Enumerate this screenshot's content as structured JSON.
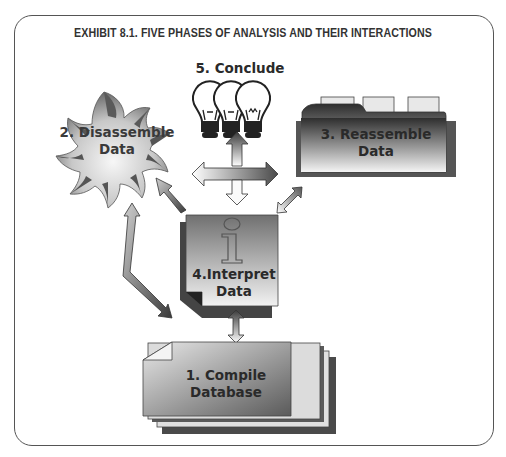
{
  "exhibit": {
    "title": "EXHIBIT 8.1.  FIVE PHASES OF ANALYSIS AND THEIR INTERACTIONS"
  },
  "phases": [
    {
      "number": "1.",
      "line1": "1. Compile",
      "line2": "Database",
      "icon": "stacked-documents-icon"
    },
    {
      "number": "2.",
      "line1": "2. Disassemble",
      "line2": "Data",
      "icon": "burst-flower-icon"
    },
    {
      "number": "3.",
      "line1": "3. Reassemble",
      "line2": "Data",
      "icon": "folder-tabs-icon"
    },
    {
      "number": "4.",
      "line1": "4.Interpret",
      "line2": "Data",
      "icon": "info-document-icon"
    },
    {
      "number": "5.",
      "line1": "5. Conclude",
      "line2": "",
      "icon": "light-bulbs-icon"
    }
  ],
  "connections": [
    {
      "from": "1. Compile Database",
      "to": "4. Interpret Data",
      "type": "bidirectional"
    },
    {
      "from": "1. Compile Database",
      "to": "2. Disassemble Data",
      "type": "bidirectional"
    },
    {
      "from": "4. Interpret Data",
      "to": "2. Disassemble Data",
      "type": "directional"
    },
    {
      "from": "4. Interpret Data",
      "to": "3. Reassemble Data",
      "type": "bidirectional"
    },
    {
      "from": "center",
      "to": [
        "2. Disassemble Data",
        "3. Reassemble Data",
        "5. Conclude",
        "4. Interpret Data"
      ],
      "type": "four-way"
    }
  ]
}
